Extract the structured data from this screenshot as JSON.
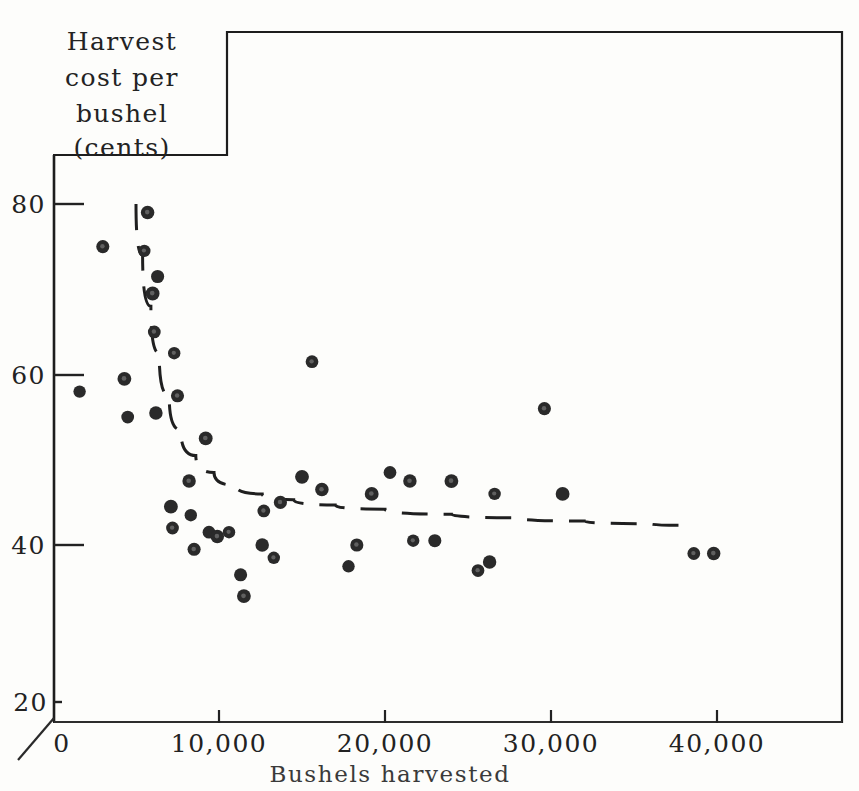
{
  "figure": {
    "background_color": "#fdfdfb",
    "ink_color": "#1a1a1a",
    "frame": {
      "name": "page-border",
      "top_y": 32,
      "step_x": 227,
      "step_y": 155,
      "left_x": 53,
      "right_x": 842,
      "bottom_y": 722
    }
  },
  "chart_data": {
    "type": "scatter",
    "title": "",
    "ylabel_lines": [
      "Harvest",
      "cost per",
      "bushel",
      "(cents)"
    ],
    "xlabel": "Bushels harvested",
    "xlim": [
      0,
      47000
    ],
    "ylim": [
      20,
      84
    ],
    "grid": false,
    "legend": "none",
    "xticks": [
      0,
      10000,
      20000,
      30000,
      40000
    ],
    "xtick_labels": [
      "0",
      "10,000",
      "20,000",
      "30,000",
      "40,000"
    ],
    "yticks": [
      20,
      40,
      60,
      80
    ],
    "ytick_labels": [
      "20",
      "40",
      "60",
      "80"
    ],
    "axis_break": true,
    "marker_style": "filled-circle",
    "marker_color": "#2a2a2a",
    "points": [
      {
        "x": 1600,
        "y": 58.0
      },
      {
        "x": 3000,
        "y": 75.0
      },
      {
        "x": 4300,
        "y": 59.5
      },
      {
        "x": 4500,
        "y": 55.0
      },
      {
        "x": 5700,
        "y": 79.0
      },
      {
        "x": 5500,
        "y": 74.5
      },
      {
        "x": 6300,
        "y": 71.5
      },
      {
        "x": 6000,
        "y": 69.5
      },
      {
        "x": 6100,
        "y": 65.0
      },
      {
        "x": 6200,
        "y": 55.5
      },
      {
        "x": 7300,
        "y": 62.5
      },
      {
        "x": 7500,
        "y": 57.5
      },
      {
        "x": 7100,
        "y": 44.5
      },
      {
        "x": 7200,
        "y": 42.0
      },
      {
        "x": 8200,
        "y": 47.5
      },
      {
        "x": 8300,
        "y": 43.5
      },
      {
        "x": 8500,
        "y": 39.5
      },
      {
        "x": 9200,
        "y": 52.5
      },
      {
        "x": 9400,
        "y": 41.5
      },
      {
        "x": 9900,
        "y": 41.0
      },
      {
        "x": 10600,
        "y": 41.5
      },
      {
        "x": 11300,
        "y": 36.5
      },
      {
        "x": 11500,
        "y": 34.0
      },
      {
        "x": 12700,
        "y": 44.0
      },
      {
        "x": 12600,
        "y": 40.0
      },
      {
        "x": 13300,
        "y": 38.5
      },
      {
        "x": 13700,
        "y": 45.0
      },
      {
        "x": 15000,
        "y": 48.0
      },
      {
        "x": 15600,
        "y": 61.5
      },
      {
        "x": 16200,
        "y": 46.5
      },
      {
        "x": 17800,
        "y": 37.5
      },
      {
        "x": 18300,
        "y": 40.0
      },
      {
        "x": 19200,
        "y": 46.0
      },
      {
        "x": 20300,
        "y": 48.5
      },
      {
        "x": 21500,
        "y": 47.5
      },
      {
        "x": 21700,
        "y": 40.5
      },
      {
        "x": 23000,
        "y": 40.5
      },
      {
        "x": 24000,
        "y": 47.5
      },
      {
        "x": 25600,
        "y": 37.0
      },
      {
        "x": 26300,
        "y": 38.0
      },
      {
        "x": 26600,
        "y": 46.0
      },
      {
        "x": 29600,
        "y": 56.0
      },
      {
        "x": 30700,
        "y": 46.0
      },
      {
        "x": 38600,
        "y": 39.0
      },
      {
        "x": 39800,
        "y": 39.0
      }
    ],
    "fitted_curve": {
      "name": "dashed-trend-curve",
      "style": "dashed",
      "description": "hyperbolic cost curve declining steeply then flattening",
      "points": [
        {
          "x": 5000,
          "y": 80.0
        },
        {
          "x": 5400,
          "y": 74.0
        },
        {
          "x": 5900,
          "y": 68.0
        },
        {
          "x": 6400,
          "y": 62.5
        },
        {
          "x": 7000,
          "y": 57.5
        },
        {
          "x": 7700,
          "y": 53.5
        },
        {
          "x": 8600,
          "y": 50.5
        },
        {
          "x": 9700,
          "y": 48.5
        },
        {
          "x": 11000,
          "y": 47.0
        },
        {
          "x": 12600,
          "y": 46.0
        },
        {
          "x": 14500,
          "y": 45.3
        },
        {
          "x": 17000,
          "y": 44.7
        },
        {
          "x": 20000,
          "y": 44.2
        },
        {
          "x": 24000,
          "y": 43.6
        },
        {
          "x": 28000,
          "y": 43.2
        },
        {
          "x": 32000,
          "y": 42.8
        },
        {
          "x": 36000,
          "y": 42.5
        },
        {
          "x": 38400,
          "y": 42.3
        }
      ]
    }
  }
}
